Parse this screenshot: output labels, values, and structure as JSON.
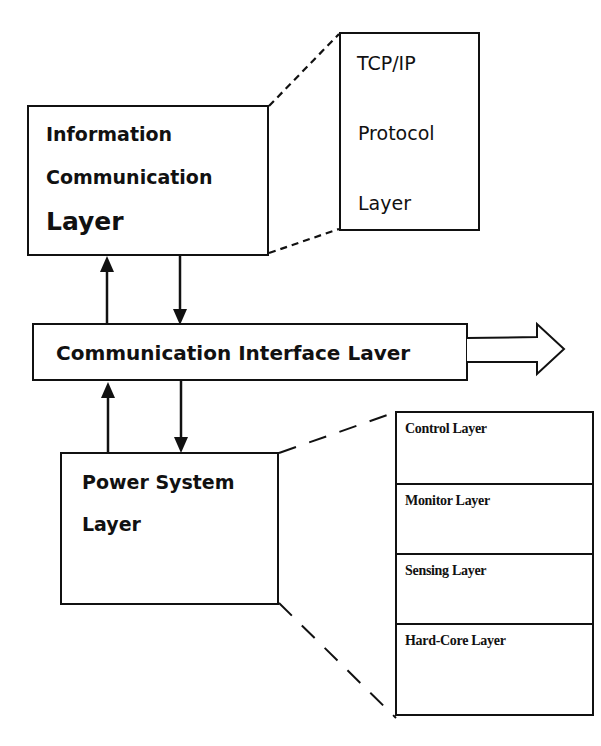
{
  "diagram": {
    "info_comm_layer": {
      "line1": "Information",
      "line2": "Communication",
      "line3": "Layer"
    },
    "tcpip_detail": {
      "line1": "TCP/IP",
      "line2": "Protocol",
      "line3": "Layer"
    },
    "comm_interface_layer": {
      "label": "Communication Interface Laver"
    },
    "power_system_layer": {
      "line1": "Power System",
      "line2": "Layer"
    },
    "power_detail": {
      "rows": [
        {
          "label": "Control Layer"
        },
        {
          "label": "Monitor Layer"
        },
        {
          "label": "Sensing Layer"
        },
        {
          "label": "Hard-Core Layer"
        }
      ]
    },
    "connectors": [
      {
        "from": "comm_interface_layer",
        "to": "info_comm_layer",
        "type": "arrow-up"
      },
      {
        "from": "info_comm_layer",
        "to": "comm_interface_layer",
        "type": "arrow-down"
      },
      {
        "from": "power_system_layer",
        "to": "comm_interface_layer",
        "type": "arrow-up"
      },
      {
        "from": "comm_interface_layer",
        "to": "power_system_layer",
        "type": "arrow-down"
      },
      {
        "from": "comm_interface_layer",
        "to": "external",
        "type": "hollow-arrow-right"
      },
      {
        "from": "info_comm_layer",
        "to": "tcpip_detail",
        "type": "dashed-zoom"
      },
      {
        "from": "power_system_layer",
        "to": "power_detail",
        "type": "dashed-zoom"
      }
    ]
  }
}
